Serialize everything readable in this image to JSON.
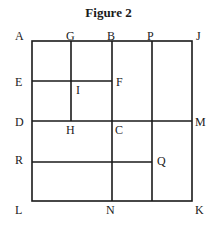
{
  "title": "Figure 2",
  "colors": {
    "line": "#1a1a1a",
    "background": "#ffffff"
  },
  "labels": {
    "A": "A",
    "G": "G",
    "B": "B",
    "P": "P",
    "J": "J",
    "E": "E",
    "I": "I",
    "F": "F",
    "D": "D",
    "H": "H",
    "C": "C",
    "M": "M",
    "R": "R",
    "Q": "Q",
    "L": "L",
    "N": "N",
    "K": "K"
  },
  "geometry": {
    "outer_square": [
      "A",
      "J",
      "K",
      "L"
    ],
    "segments": [
      [
        "G",
        "H"
      ],
      [
        "B",
        "N"
      ],
      [
        "P",
        "Q-line-bottom"
      ],
      [
        "E",
        "F"
      ],
      [
        "D",
        "M"
      ],
      [
        "R",
        "Q"
      ]
    ]
  }
}
